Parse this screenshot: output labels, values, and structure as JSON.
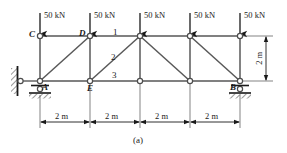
{
  "figure": {
    "caption": "(a)",
    "colors": {
      "member": "#595959",
      "chord": "#808080",
      "node_stroke": "#4d4d4d",
      "node_fill": "#ffffff",
      "arrow": "#1a1a1a",
      "text": "#1a1a1a",
      "dim": "#4d4d4d",
      "hatch": "#333333",
      "background": "#ffffff"
    }
  },
  "loads": [
    {
      "id": "load-at-C",
      "label": "50 kN",
      "magnitude": 50,
      "unit": "kN",
      "direction": "down",
      "at_node": "C"
    },
    {
      "id": "load-at-D",
      "label": "50 kN",
      "magnitude": 50,
      "unit": "kN",
      "direction": "down",
      "at_node": "D"
    },
    {
      "id": "load-at-F",
      "label": "50 kN",
      "magnitude": 50,
      "unit": "kN",
      "direction": "down",
      "at_node": "F"
    },
    {
      "id": "load-at-G",
      "label": "50 kN",
      "magnitude": 50,
      "unit": "kN",
      "direction": "down",
      "at_node": "G"
    },
    {
      "id": "load-at-H",
      "label": "50 kN",
      "magnitude": 50,
      "unit": "kN",
      "direction": "down",
      "at_node": "H"
    }
  ],
  "node_labels": [
    {
      "id": "node-label-C",
      "label": "C"
    },
    {
      "id": "node-label-D",
      "label": "D"
    },
    {
      "id": "node-label-A",
      "label": "A"
    },
    {
      "id": "node-label-E",
      "label": "E"
    },
    {
      "id": "node-label-B",
      "label": "B"
    }
  ],
  "member_labels": [
    {
      "id": "member-label-1",
      "label": "1",
      "member": "top chord D-F"
    },
    {
      "id": "member-label-2",
      "label": "2",
      "member": "diagonal E-F"
    },
    {
      "id": "member-label-3",
      "label": "3",
      "member": "bottom chord E-I"
    }
  ],
  "dimensions": {
    "horizontal": [
      {
        "id": "dim-span-1",
        "label": "2 m",
        "value": 2,
        "unit": "m"
      },
      {
        "id": "dim-span-2",
        "label": "2 m",
        "value": 2,
        "unit": "m"
      },
      {
        "id": "dim-span-3",
        "label": "2 m",
        "value": 2,
        "unit": "m"
      },
      {
        "id": "dim-span-4",
        "label": "2 m",
        "value": 2,
        "unit": "m"
      }
    ],
    "vertical": {
      "id": "dim-height",
      "label": "2 m",
      "value": 2,
      "unit": "m"
    }
  },
  "supports": [
    {
      "id": "support-wall-left",
      "type": "hatched-wall-with-link",
      "at_node": "A",
      "side": "left"
    },
    {
      "id": "support-roller-A",
      "type": "roller",
      "at_node": "A",
      "side": "below"
    },
    {
      "id": "support-roller-B",
      "type": "roller",
      "at_node": "B",
      "side": "below"
    }
  ],
  "geometry": {
    "top_chord_y": 36,
    "bottom_chord_y": 81,
    "node_x": [
      40,
      90,
      140,
      190,
      240
    ],
    "top_nodes": [
      "C",
      "D",
      "F",
      "G",
      "H"
    ],
    "bottom_nodes": [
      "A",
      "E",
      "I",
      "J",
      "B"
    ]
  }
}
